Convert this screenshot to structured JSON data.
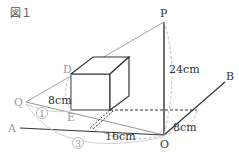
{
  "figure": {
    "title": "図１",
    "points": {
      "P": "P",
      "O": "O",
      "A": "A",
      "B": "B",
      "Q": "Q",
      "D": "D",
      "E": "E"
    },
    "measures": {
      "PO": "24cm",
      "DE": "8cm",
      "AO_segment": "16cm",
      "OB_segment": "8cm"
    },
    "ratio_marks": {
      "QE": "1",
      "QO": "3"
    },
    "colors": {
      "main_line": "#333333",
      "light_line": "#9a9a9a",
      "dash_arc": "#bbbbbb"
    }
  }
}
